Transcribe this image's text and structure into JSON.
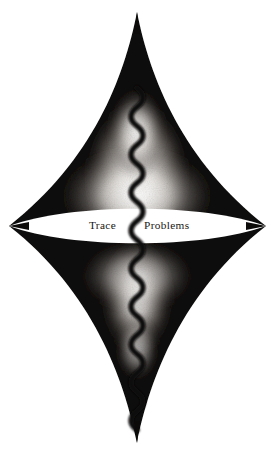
{
  "artwork": {
    "title": "Trace Problems",
    "background_color": "#ffffff",
    "ink_color": "#0d0b0a",
    "glow_color": "#ffffff",
    "width": 275,
    "height": 453,
    "description": "Four-cusped astroid-like ink form with vertical chain squiggle and white lens band",
    "caption": {
      "left_word": "Trace",
      "right_word": "Problems",
      "baseline_y": 229
    },
    "shapes": {
      "top_cusp": "top-cusp-point",
      "bottom_cusp": "bottom-cusp-point",
      "left_cusp": "left-cusp-point",
      "right_cusp": "right-cusp-point",
      "upper_lobe": "upper-lobe",
      "lower_lobe": "lower-lobe",
      "lens": "white-lens-band",
      "squiggle": "vertical-chain-squiggle"
    },
    "geometry": {
      "center_x": 137,
      "lens_center_y": 226,
      "top_tip_y": 12,
      "bottom_tip_y": 443,
      "left_tip_x": 9,
      "right_tip_x": 266
    }
  }
}
